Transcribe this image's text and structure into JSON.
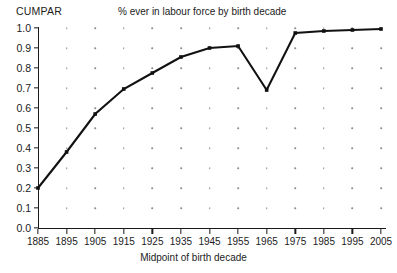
{
  "chart_data": {
    "type": "line",
    "title": "% ever in labour force by birth decade",
    "ylabel": "CUMPAR",
    "xlabel": "Midpoint of birth decade",
    "x": [
      1885,
      1895,
      1905,
      1915,
      1925,
      1935,
      1945,
      1955,
      1965,
      1975,
      1985,
      1995,
      2005
    ],
    "categories": [
      "1885",
      "1895",
      "1905",
      "1915",
      "1925",
      "1935",
      "1945",
      "1955",
      "1965",
      "1975",
      "1985",
      "1995",
      "2005"
    ],
    "values": [
      0.2,
      0.38,
      0.57,
      0.695,
      0.775,
      0.855,
      0.9,
      0.91,
      0.69,
      0.975,
      0.985,
      0.99,
      0.995
    ],
    "series": [
      {
        "name": "CUMPAR",
        "values": [
          0.2,
          0.38,
          0.57,
          0.695,
          0.775,
          0.855,
          0.9,
          0.91,
          0.69,
          0.975,
          0.985,
          0.99,
          0.995
        ]
      }
    ],
    "xlim": [
      1885,
      2005
    ],
    "ylim": [
      0.0,
      1.0
    ],
    "ytick_labels": [
      "0.0",
      "0.1",
      "0.2",
      "0.3",
      "0.4",
      "0.5",
      "0.6",
      "0.7",
      "0.8",
      "0.9",
      "1.0"
    ],
    "ytick_values": [
      0.0,
      0.1,
      0.2,
      0.3,
      0.4,
      0.5,
      0.6,
      0.7,
      0.8,
      0.9,
      1.0
    ],
    "grid": "dotted-points-at-intersections",
    "legend": "none",
    "line_color": "#111111",
    "marker": "square",
    "marker_color": "#111111"
  }
}
